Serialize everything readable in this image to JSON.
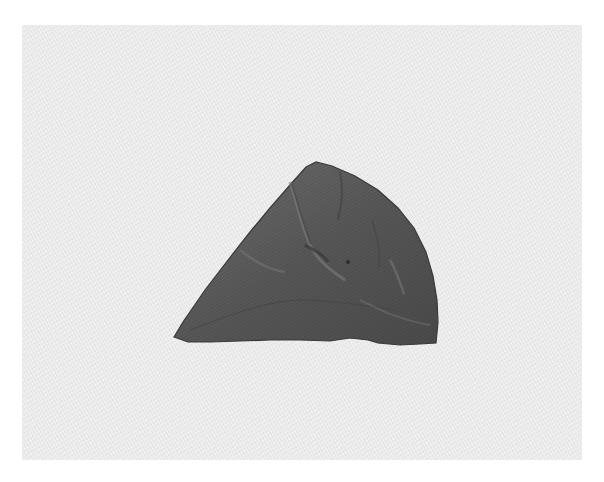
{
  "image": {
    "subject": "stone fragment",
    "background_color": "#ececec",
    "margin_color": "#ffffff",
    "object_color": "#5a5a5a",
    "object_shadow_color": "#3f3f3f",
    "object_highlight_color": "#7a7a7a"
  }
}
